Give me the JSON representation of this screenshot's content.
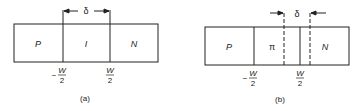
{
  "figures": [
    {
      "caption": "(a)",
      "regions": [
        "P",
        "I",
        "N"
      ],
      "dimension_label": "δ",
      "left_boundary_label": {
        "sign": "−",
        "num": "W",
        "den": "2"
      },
      "right_boundary_label": {
        "num": "W",
        "den": "2"
      }
    },
    {
      "caption": "(b)",
      "regions": [
        "P",
        "π",
        "N"
      ],
      "dimension_label": "δ",
      "left_boundary_label": {
        "sign": "−",
        "num": "W",
        "den": "2"
      },
      "right_boundary_label": {
        "num": "W",
        "den": "2"
      }
    }
  ],
  "colors": {
    "line": "#222222",
    "background": "#ffffff"
  }
}
